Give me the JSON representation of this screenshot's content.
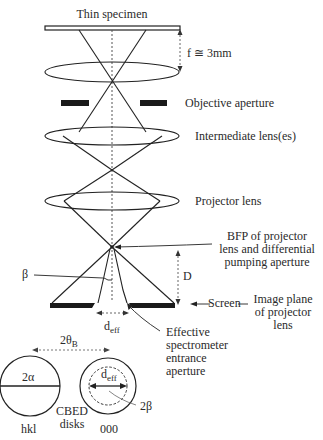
{
  "title": "Thin specimen",
  "labels": {
    "focal_length": "f ≅ 3mm",
    "objective_aperture": "Objective aperture",
    "intermediate_lens": "Intermediate lens(es)",
    "projector_lens": "Projector lens",
    "bfp_line1": "BFP of projector",
    "bfp_line2": "lens and differential",
    "bfp_line3": "pumping aperture",
    "beta": "β",
    "distance_D": "D",
    "screen": "Screen",
    "image_plane_line1": "Image plane",
    "image_plane_line2": "of projector",
    "image_plane_line3": "lens",
    "d_eff_main": "d",
    "d_eff_sub": "eff",
    "effective_line1": "Effective",
    "effective_line2": "spectrometer",
    "effective_line3": "entrance",
    "effective_line4": "aperture",
    "two_theta_main": "2θ",
    "two_theta_sub": "B",
    "two_alpha": "2α",
    "disk_d_main": "d",
    "disk_d_sub": "eff",
    "two_beta": "2β",
    "cbed_line1": "CBED",
    "cbed_line2": "disks",
    "hkl": "hkl",
    "zero": "000"
  },
  "colors": {
    "line": "#222222",
    "fill_dark": "#1a1a1a",
    "dashed": "#555555"
  }
}
